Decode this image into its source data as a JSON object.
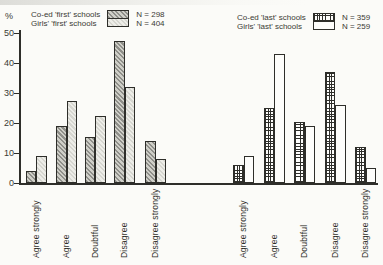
{
  "page": {
    "background": "#fbfbf8",
    "ink": "#2e2e2a"
  },
  "y_axis": {
    "label": "%",
    "ticks": [
      0,
      10,
      20,
      30,
      40,
      50
    ],
    "max": 50
  },
  "legend": {
    "first": {
      "rows": [
        {
          "label": "Co-ed 'first' schools",
          "n": "N = 298",
          "pattern": "diagonal-hatch-gray"
        },
        {
          "label": "Girls' 'first' schools",
          "n": "N = 404",
          "pattern": "light-stipple"
        }
      ]
    },
    "last": {
      "rows": [
        {
          "label": "Co-ed 'last' schools",
          "n": "N = 359",
          "pattern": "fine-crosshatch"
        },
        {
          "label": "Girls' 'last' schools",
          "n": "N = 259",
          "pattern": "plain-white"
        }
      ]
    }
  },
  "chart_data": {
    "type": "bar",
    "title": "",
    "ylabel": "%",
    "ylim": [
      0,
      50
    ],
    "yticks": [
      0,
      10,
      20,
      30,
      40,
      50
    ],
    "grid": false,
    "legend_position": "top",
    "categories": [
      "Agree strongly",
      "Agree",
      "Doubtful",
      "Disagree",
      "Disagree strongly"
    ],
    "groups": [
      {
        "name": "first schools",
        "series": [
          {
            "name": "Co-ed 'first' schools",
            "n": 298,
            "pattern": "diagonal-hatch-gray",
            "values": [
              4,
              19,
              15.5,
              47.5,
              14
            ]
          },
          {
            "name": "Girls' 'first' schools",
            "n": 404,
            "pattern": "light-stipple",
            "values": [
              9,
              27.5,
              22.5,
              32,
              8
            ]
          }
        ]
      },
      {
        "name": "last schools",
        "series": [
          {
            "name": "Co-ed 'last' schools",
            "n": 359,
            "pattern": "fine-crosshatch",
            "values": [
              6,
              25,
              20.5,
              37,
              12
            ]
          },
          {
            "name": "Girls' 'last' schools",
            "n": 259,
            "pattern": "plain-white",
            "values": [
              9,
              43,
              19,
              26,
              5
            ]
          }
        ]
      }
    ]
  }
}
